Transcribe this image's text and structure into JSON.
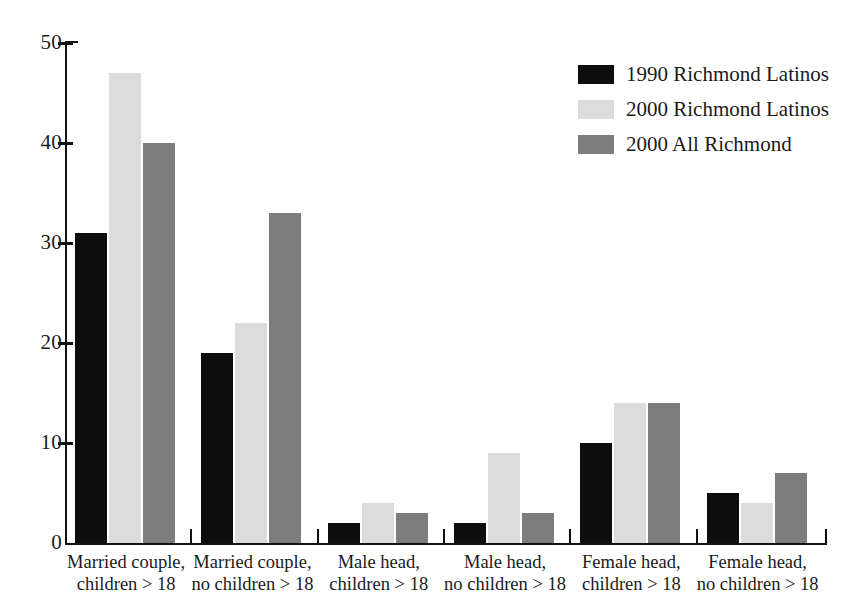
{
  "chart_data": {
    "type": "bar",
    "title": "",
    "subtitle": "",
    "xlabel": "",
    "ylabel": "",
    "ylim": [
      0,
      50
    ],
    "yticks": [
      0,
      10,
      20,
      30,
      40,
      50
    ],
    "grid": false,
    "legend_position": "top-right",
    "categories": [
      "Married couple,\nchildren > 18",
      "Married couple,\nno children > 18",
      "Male head,\nchildren > 18",
      "Male head,\nno children > 18",
      "Female head,\nchildren > 18",
      "Female head,\nno children > 18"
    ],
    "category_lines": [
      [
        "Married couple,",
        "children > 18"
      ],
      [
        "Married couple,",
        "no children > 18"
      ],
      [
        "Male head,",
        "children > 18"
      ],
      [
        "Male head,",
        "no children > 18"
      ],
      [
        "Female head,",
        "children > 18"
      ],
      [
        "Female head,",
        "no children > 18"
      ]
    ],
    "series": [
      {
        "name": "1990 Richmond Latinos",
        "color": "#0d0d0d",
        "values": [
          31,
          19,
          2,
          2,
          10,
          5
        ]
      },
      {
        "name": "2000 Richmond Latinos",
        "color": "#dcdcdc",
        "values": [
          47,
          22,
          4,
          9,
          14,
          4
        ]
      },
      {
        "name": "2000 All Richmond",
        "color": "#7d7d7d",
        "values": [
          40,
          33,
          3,
          3,
          14,
          7
        ]
      }
    ]
  },
  "axis": {
    "y_tick_labels": [
      "50",
      "40",
      "30",
      "20",
      "10",
      "0"
    ]
  },
  "legend": {
    "entries": [
      {
        "label": "1990 Richmond Latinos",
        "color": "#0d0d0d"
      },
      {
        "label": "2000 Richmond Latinos",
        "color": "#dcdcdc"
      },
      {
        "label": "2000 All Richmond",
        "color": "#7d7d7d"
      }
    ]
  }
}
